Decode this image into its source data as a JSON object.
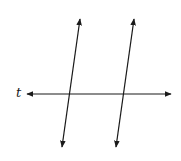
{
  "diagram": {
    "transversal_label": "t",
    "line_color": "#1a1a1a",
    "background": "#ffffff",
    "lines": [
      {
        "name": "transversal-t",
        "x1": 27,
        "y1": 94,
        "x2": 171,
        "y2": 94
      },
      {
        "name": "parallel-line-left",
        "x1": 80,
        "y1": 19,
        "x2": 62,
        "y2": 147
      },
      {
        "name": "parallel-line-right",
        "x1": 134,
        "y1": 19,
        "x2": 116,
        "y2": 147
      }
    ]
  }
}
